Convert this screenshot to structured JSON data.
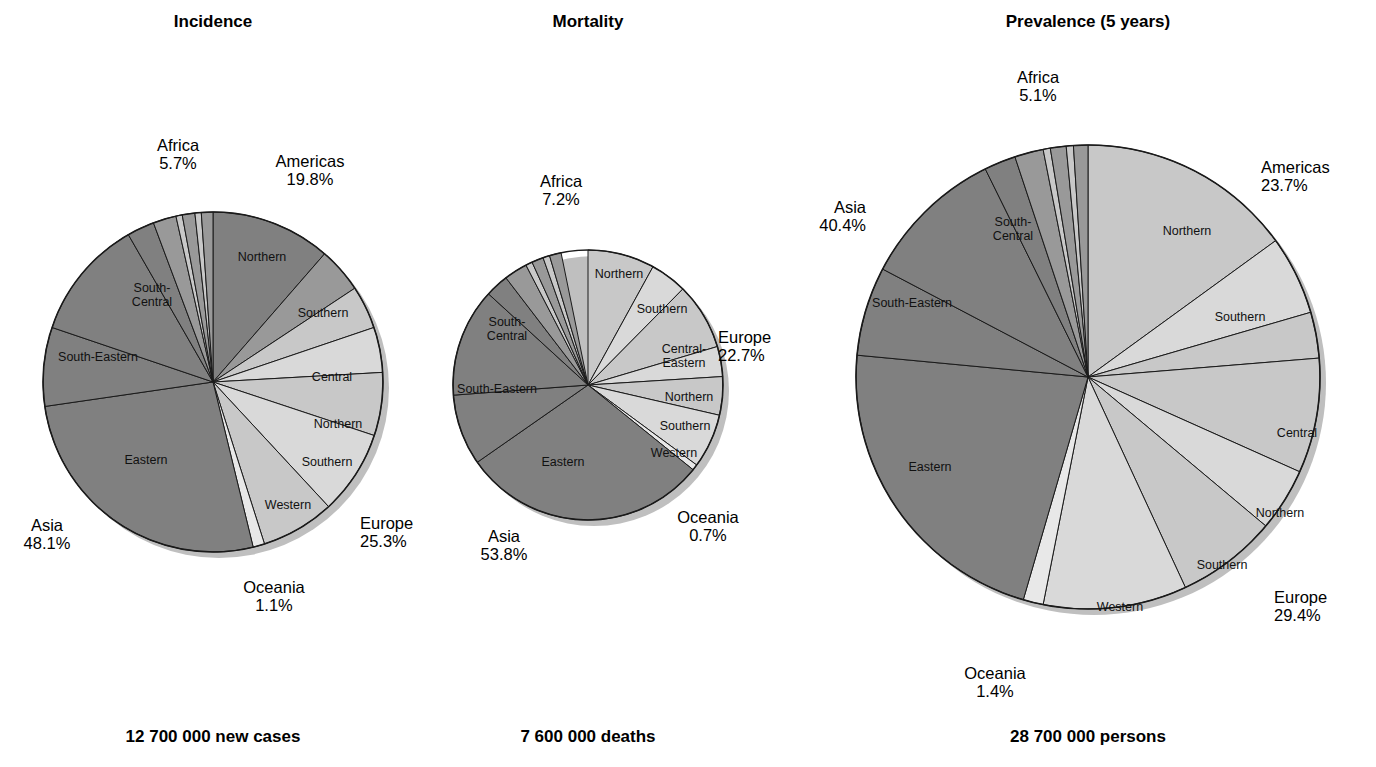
{
  "figure": {
    "background": "#ffffff",
    "colors": {
      "dark_gray": "#808080",
      "mid_gray": "#999999",
      "light_gray": "#c8c8c8",
      "pale_gray": "#d9d9d9",
      "very_light": "#e8e8e8",
      "outline": "#1a1a1a",
      "shadow": "#bfbfbf"
    }
  },
  "chart_data": [
    {
      "type": "pie",
      "title": "Incidence",
      "footer": "12 700 000 new cases",
      "total_label": "12 700 000 new cases",
      "continents": [
        {
          "name": "Africa",
          "percent": 5.7,
          "percent_label": "5.7%"
        },
        {
          "name": "Americas",
          "percent": 19.8,
          "percent_label": "19.8%"
        },
        {
          "name": "Europe",
          "percent": 25.3,
          "percent_label": "25.3%"
        },
        {
          "name": "Oceania",
          "percent": 1.1,
          "percent_label": "1.1%"
        },
        {
          "name": "Asia",
          "percent": 48.1,
          "percent_label": "48.1%"
        }
      ],
      "slices": [
        {
          "continent": "Americas",
          "region": "Northern",
          "percent": 11.4,
          "shade": "dark_gray",
          "label_shown": true
        },
        {
          "continent": "Americas",
          "region": "Southern",
          "percent": 4.3,
          "shade": "mid_gray",
          "label_shown": true
        },
        {
          "continent": "Americas",
          "region": "Central",
          "percent": 4.1,
          "shade": "light_gray",
          "label_shown": true
        },
        {
          "continent": "Europe",
          "region": "Central",
          "percent": 0.0,
          "shade": "light_gray",
          "label_shown": false
        },
        {
          "continent": "Europe",
          "region": "Northern",
          "percent": 4.3,
          "shade": "pale_gray",
          "label_shown": true
        },
        {
          "continent": "Europe",
          "region": "Southern",
          "percent": 6.0,
          "shade": "light_gray",
          "label_shown": true
        },
        {
          "continent": "Europe",
          "region": "Western",
          "percent": 8.0,
          "shade": "pale_gray",
          "label_shown": true
        },
        {
          "continent": "Europe",
          "region": "Eastern",
          "percent": 7.0,
          "shade": "light_gray",
          "label_shown": false
        },
        {
          "continent": "Oceania",
          "region": "Oceania",
          "percent": 1.1,
          "shade": "very_light",
          "label_shown": false
        },
        {
          "continent": "Asia",
          "region": "Eastern",
          "percent": 26.5,
          "shade": "dark_gray",
          "label_shown": true
        },
        {
          "continent": "Asia",
          "region": "South-Eastern",
          "percent": 7.5,
          "shade": "dark_gray",
          "label_shown": true
        },
        {
          "continent": "Asia",
          "region": "South-Central",
          "percent": 11.5,
          "shade": "dark_gray",
          "label_shown": true
        },
        {
          "continent": "Asia",
          "region": "Western",
          "percent": 2.6,
          "shade": "dark_gray",
          "label_shown": false
        },
        {
          "continent": "Africa",
          "region": "Eastern",
          "percent": 2.2,
          "shade": "mid_gray",
          "label_shown": false
        },
        {
          "continent": "Africa",
          "region": "Middle",
          "percent": 0.6,
          "shade": "light_gray",
          "label_shown": false
        },
        {
          "continent": "Africa",
          "region": "Northern",
          "percent": 1.2,
          "shade": "mid_gray",
          "label_shown": false
        },
        {
          "continent": "Africa",
          "region": "Southern",
          "percent": 0.6,
          "shade": "light_gray",
          "label_shown": false
        },
        {
          "continent": "Africa",
          "region": "Western",
          "percent": 1.1,
          "shade": "mid_gray",
          "label_shown": false
        }
      ]
    },
    {
      "type": "pie",
      "title": "Mortality",
      "footer": "7 600 000 deaths",
      "total_label": "7 600 000 deaths",
      "continents": [
        {
          "name": "Africa",
          "percent": 7.2,
          "percent_label": "7.2%"
        },
        {
          "name": "Europe",
          "percent": 22.7,
          "percent_label": "22.7%"
        },
        {
          "name": "Oceania",
          "percent": 0.7,
          "percent_label": "0.7%"
        },
        {
          "name": "Asia",
          "percent": 53.8,
          "percent_label": "53.8%"
        }
      ],
      "slices": [
        {
          "continent": "Americas",
          "region": "Northern",
          "percent": 8.0,
          "shade": "light_gray",
          "label_shown": true
        },
        {
          "continent": "Americas",
          "region": "Southern",
          "percent": 4.4,
          "shade": "pale_gray",
          "label_shown": true
        },
        {
          "continent": "Europe",
          "region": "Central-Eastern",
          "percent": 8.0,
          "shade": "light_gray",
          "label_shown": true
        },
        {
          "continent": "Europe",
          "region": "Northern",
          "percent": 3.6,
          "shade": "pale_gray",
          "label_shown": true
        },
        {
          "continent": "Europe",
          "region": "Southern",
          "percent": 4.6,
          "shade": "light_gray",
          "label_shown": true
        },
        {
          "continent": "Europe",
          "region": "Western",
          "percent": 6.5,
          "shade": "pale_gray",
          "label_shown": true
        },
        {
          "continent": "Oceania",
          "region": "Oceania",
          "percent": 0.7,
          "shade": "very_light",
          "label_shown": false
        },
        {
          "continent": "Asia",
          "region": "Eastern",
          "percent": 29.5,
          "shade": "dark_gray",
          "label_shown": true
        },
        {
          "continent": "Asia",
          "region": "South-Eastern",
          "percent": 8.5,
          "shade": "dark_gray",
          "label_shown": true
        },
        {
          "continent": "Asia",
          "region": "South-Central",
          "percent": 13.0,
          "shade": "dark_gray",
          "label_shown": true
        },
        {
          "continent": "Asia",
          "region": "Western",
          "percent": 2.8,
          "shade": "dark_gray",
          "label_shown": false
        },
        {
          "continent": "Africa",
          "region": "Eastern",
          "percent": 2.8,
          "shade": "mid_gray",
          "label_shown": false
        },
        {
          "continent": "Africa",
          "region": "Middle",
          "percent": 0.8,
          "shade": "light_gray",
          "label_shown": false
        },
        {
          "continent": "Africa",
          "region": "Northern",
          "percent": 1.4,
          "shade": "mid_gray",
          "label_shown": false
        },
        {
          "continent": "Africa",
          "region": "Southern",
          "percent": 0.8,
          "shade": "light_gray",
          "label_shown": false
        },
        {
          "continent": "Africa",
          "region": "Western",
          "percent": 1.4,
          "shade": "mid_gray",
          "label_shown": false
        }
      ]
    },
    {
      "type": "pie",
      "title": "Prevalence (5 years)",
      "footer": "28 700 000 persons",
      "total_label": "28 700 000 persons",
      "continents": [
        {
          "name": "Africa",
          "percent": 5.1,
          "percent_label": "5.1%"
        },
        {
          "name": "Americas",
          "percent": 23.7,
          "percent_label": "23.7%"
        },
        {
          "name": "Europe",
          "percent": 29.4,
          "percent_label": "29.4%"
        },
        {
          "name": "Oceania",
          "percent": 1.4,
          "percent_label": "1.4%"
        },
        {
          "name": "Asia",
          "percent": 40.4,
          "percent_label": "40.4%"
        }
      ],
      "slices": [
        {
          "continent": "Americas",
          "region": "Northern",
          "percent": 15.0,
          "shade": "light_gray",
          "label_shown": true
        },
        {
          "continent": "Americas",
          "region": "Southern",
          "percent": 5.5,
          "shade": "pale_gray",
          "label_shown": true
        },
        {
          "continent": "Americas",
          "region": "Central",
          "percent": 3.2,
          "shade": "light_gray",
          "label_shown": false
        },
        {
          "continent": "Europe",
          "region": "Central",
          "percent": 8.0,
          "shade": "light_gray",
          "label_shown": true
        },
        {
          "continent": "Europe",
          "region": "Northern",
          "percent": 4.4,
          "shade": "pale_gray",
          "label_shown": true
        },
        {
          "continent": "Europe",
          "region": "Southern",
          "percent": 7.0,
          "shade": "light_gray",
          "label_shown": true
        },
        {
          "continent": "Europe",
          "region": "Western",
          "percent": 10.0,
          "shade": "pale_gray",
          "label_shown": true
        },
        {
          "continent": "Oceania",
          "region": "Oceania",
          "percent": 1.4,
          "shade": "very_light",
          "label_shown": false
        },
        {
          "continent": "Asia",
          "region": "Eastern",
          "percent": 22.0,
          "shade": "dark_gray",
          "label_shown": true
        },
        {
          "continent": "Asia",
          "region": "South-Eastern",
          "percent": 6.2,
          "shade": "dark_gray",
          "label_shown": true
        },
        {
          "continent": "Asia",
          "region": "South-Central",
          "percent": 10.0,
          "shade": "dark_gray",
          "label_shown": true
        },
        {
          "continent": "Asia",
          "region": "Western",
          "percent": 2.2,
          "shade": "dark_gray",
          "label_shown": false
        },
        {
          "continent": "Africa",
          "region": "Eastern",
          "percent": 2.0,
          "shade": "mid_gray",
          "label_shown": false
        },
        {
          "continent": "Africa",
          "region": "Middle",
          "percent": 0.5,
          "shade": "light_gray",
          "label_shown": false
        },
        {
          "continent": "Africa",
          "region": "Northern",
          "percent": 1.1,
          "shade": "mid_gray",
          "label_shown": false
        },
        {
          "continent": "Africa",
          "region": "Southern",
          "percent": 0.5,
          "shade": "light_gray",
          "label_shown": false
        },
        {
          "continent": "Africa",
          "region": "Western",
          "percent": 1.0,
          "shade": "mid_gray",
          "label_shown": false
        }
      ]
    }
  ],
  "panels": {
    "incidence": {
      "title": "Incidence",
      "footer": "12 700 000 new cases",
      "callouts": {
        "africa_name": "Africa",
        "africa_pct": "5.7%",
        "americas_name": "Americas",
        "americas_pct": "19.8%",
        "europe_name": "Europe",
        "europe_pct": "25.3%",
        "oceania_name": "Oceania",
        "oceania_pct": "1.1%",
        "asia_name": "Asia",
        "asia_pct": "48.1%"
      },
      "slice_labels": {
        "am_northern": "Northern",
        "am_southern": "Southern",
        "eu_central": "Central",
        "eu_northern": "Northern",
        "eu_southern": "Southern",
        "eu_western": "Western",
        "as_eastern": "Eastern",
        "as_south_eastern": "South-Eastern",
        "as_south_central_1": "South-",
        "as_south_central_2": "Central"
      }
    },
    "mortality": {
      "title": "Mortality",
      "footer": "7 600 000 deaths",
      "callouts": {
        "africa_name": "Africa",
        "africa_pct": "7.2%",
        "europe_name": "Europe",
        "europe_pct": "22.7%",
        "oceania_name": "Oceania",
        "oceania_pct": "0.7%",
        "asia_name": "Asia",
        "asia_pct": "53.8%"
      },
      "slice_labels": {
        "am_northern": "Northern",
        "am_southern": "Southern",
        "eu_central_eastern_1": "Central-",
        "eu_central_eastern_2": "Eastern",
        "eu_northern": "Northern",
        "eu_southern": "Southern",
        "eu_western": "Western",
        "as_eastern": "Eastern",
        "as_south_eastern": "South-Eastern",
        "as_south_central_1": "South-",
        "as_south_central_2": "Central"
      }
    },
    "prevalence": {
      "title": "Prevalence (5 years)",
      "footer": "28 700 000 persons",
      "callouts": {
        "africa_name": "Africa",
        "africa_pct": "5.1%",
        "americas_name": "Americas",
        "americas_pct": "23.7%",
        "europe_name": "Europe",
        "europe_pct": "29.4%",
        "oceania_name": "Oceania",
        "oceania_pct": "1.4%",
        "asia_name": "Asia",
        "asia_pct": "40.4%"
      },
      "slice_labels": {
        "am_northern": "Northern",
        "am_southern": "Southern",
        "eu_central": "Central",
        "eu_northern": "Northern",
        "eu_southern": "Southern",
        "eu_western": "Western",
        "as_eastern": "Eastern",
        "as_south_eastern": "South-Eastern",
        "as_south_central_1": "South-",
        "as_south_central_2": "Central"
      }
    }
  }
}
